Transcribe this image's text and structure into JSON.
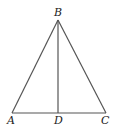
{
  "diagram": {
    "type": "triangle-with-altitude",
    "points": {
      "A": {
        "label": "A",
        "x": 12,
        "y": 113
      },
      "B": {
        "label": "B",
        "x": 58,
        "y": 20
      },
      "C": {
        "label": "C",
        "x": 106,
        "y": 113
      },
      "D": {
        "label": "D",
        "x": 58,
        "y": 113
      }
    },
    "segments": [
      "AB",
      "BC",
      "AC",
      "BD"
    ],
    "line_color": "#555555"
  }
}
